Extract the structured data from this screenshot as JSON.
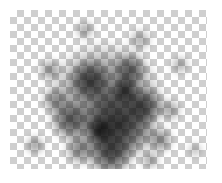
{
  "layer_preview": {
    "background": "transparency-checkerboard",
    "checker_colors": [
      "#ffffff",
      "#cfcfcf"
    ],
    "checker_size_px": 7,
    "content": "noisy-dark-cloud",
    "cloud_color": "#000000"
  },
  "blobs": [
    {
      "x": 95,
      "y": 90,
      "r": 60,
      "a": 0.55
    },
    {
      "x": 110,
      "y": 115,
      "r": 38,
      "a": 0.75
    },
    {
      "x": 80,
      "y": 70,
      "r": 22,
      "a": 0.7
    },
    {
      "x": 120,
      "y": 60,
      "r": 18,
      "a": 0.6
    },
    {
      "x": 135,
      "y": 95,
      "r": 20,
      "a": 0.65
    },
    {
      "x": 60,
      "y": 110,
      "r": 20,
      "a": 0.6
    },
    {
      "x": 100,
      "y": 145,
      "r": 24,
      "a": 0.7
    },
    {
      "x": 70,
      "y": 140,
      "r": 16,
      "a": 0.5
    },
    {
      "x": 150,
      "y": 130,
      "r": 14,
      "a": 0.5
    },
    {
      "x": 40,
      "y": 60,
      "r": 12,
      "a": 0.45
    },
    {
      "x": 25,
      "y": 135,
      "r": 10,
      "a": 0.45
    },
    {
      "x": 170,
      "y": 55,
      "r": 10,
      "a": 0.35
    },
    {
      "x": 160,
      "y": 100,
      "r": 12,
      "a": 0.4
    },
    {
      "x": 75,
      "y": 20,
      "r": 10,
      "a": 0.4
    },
    {
      "x": 130,
      "y": 30,
      "r": 12,
      "a": 0.35
    },
    {
      "x": 45,
      "y": 90,
      "r": 14,
      "a": 0.45
    },
    {
      "x": 115,
      "y": 80,
      "r": 14,
      "a": 0.8
    },
    {
      "x": 90,
      "y": 120,
      "r": 14,
      "a": 0.85
    },
    {
      "x": 140,
      "y": 150,
      "r": 10,
      "a": 0.4
    },
    {
      "x": 185,
      "y": 140,
      "r": 8,
      "a": 0.3
    }
  ]
}
